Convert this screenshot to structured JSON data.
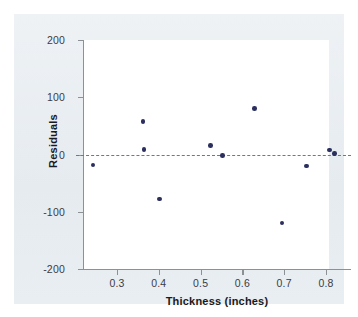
{
  "figure": {
    "background_color": "#e9eef2",
    "plot_background_color": "#ffffff",
    "marker_color": "#2b2f5e",
    "reference_line_color": "#d9542b"
  },
  "chart_data": {
    "type": "scatter",
    "title": "",
    "xlabel": "Thickness (inches)",
    "ylabel": "Residuals",
    "xlim": [
      0.215,
      0.855
    ],
    "ylim": [
      -220,
      220
    ],
    "xticks": [
      0.3,
      0.4,
      0.5,
      0.6,
      0.7,
      0.8
    ],
    "xtick_labels": [
      "0.3",
      "0.4",
      "0.5",
      "0.6",
      "0.7",
      "0.8"
    ],
    "yticks": [
      200,
      100,
      0,
      -100,
      -200
    ],
    "ytick_labels": [
      "200",
      "100",
      "0",
      "-100",
      "-200"
    ],
    "grid": false,
    "legend": null,
    "reference_lines": [
      {
        "name": "zero-residual-line",
        "y": 0,
        "style": "dashed",
        "color": "#d9542b"
      }
    ],
    "x": [
      0.243,
      0.362,
      0.365,
      0.401,
      0.523,
      0.552,
      0.629,
      0.695,
      0.754,
      0.808,
      0.82
    ],
    "y": [
      -18,
      58,
      9,
      -78,
      16,
      -2,
      80,
      -120,
      -20,
      8,
      2
    ],
    "points": [
      {
        "x": 0.243,
        "y": -18
      },
      {
        "x": 0.362,
        "y": 58
      },
      {
        "x": 0.365,
        "y": 9
      },
      {
        "x": 0.401,
        "y": -78
      },
      {
        "x": 0.523,
        "y": 16
      },
      {
        "x": 0.552,
        "y": -2
      },
      {
        "x": 0.629,
        "y": 80
      },
      {
        "x": 0.695,
        "y": -120
      },
      {
        "x": 0.754,
        "y": -20
      },
      {
        "x": 0.808,
        "y": 8
      },
      {
        "x": 0.82,
        "y": 2
      }
    ]
  }
}
